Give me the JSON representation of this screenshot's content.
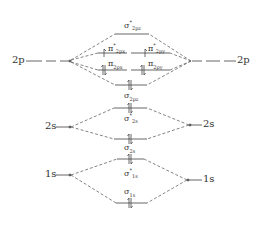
{
  "diagram": {
    "colors": {
      "line": "#555555",
      "text": "#333333",
      "background": "#ffffff"
    },
    "atomic_orbitals": {
      "left": [
        {
          "label": "2p",
          "y": 61
        },
        {
          "label": "2s",
          "y": 127
        },
        {
          "label": "1s",
          "y": 175
        }
      ],
      "right": [
        {
          "label": "2p",
          "y": 61
        },
        {
          "label": "2s",
          "y": 125
        },
        {
          "label": "1s",
          "y": 180
        }
      ]
    },
    "molecular_orbitals": [
      {
        "id": "sigma_star_2pz",
        "sym": "σ",
        "star": "*",
        "sub": "2p",
        "subsub": "z",
        "electrons": 0
      },
      {
        "id": "pi_star_2px",
        "sym": "π",
        "star": "*",
        "sub": "2p",
        "subsub": "x",
        "electrons": 1
      },
      {
        "id": "pi_star_2py",
        "sym": "π",
        "star": "*",
        "sub": "2p",
        "subsub": "y",
        "electrons": 1
      },
      {
        "id": "pi_2px",
        "sym": "π",
        "star": "",
        "sub": "2p",
        "subsub": "x",
        "electrons": 2
      },
      {
        "id": "pi_2py",
        "sym": "π",
        "star": "",
        "sub": "2p",
        "subsub": "y",
        "electrons": 2
      },
      {
        "id": "sigma_2pz",
        "sym": "σ",
        "star": "",
        "sub": "2p",
        "subsub": "z",
        "electrons": 2
      },
      {
        "id": "sigma_star_2s",
        "sym": "σ",
        "star": "*",
        "sub": "2s",
        "subsub": "",
        "electrons": 2
      },
      {
        "id": "sigma_2s",
        "sym": "σ",
        "star": "",
        "sub": "2s",
        "subsub": "",
        "electrons": 2
      },
      {
        "id": "sigma_star_1s",
        "sym": "σ",
        "star": "*",
        "sub": "1s",
        "subsub": "",
        "electrons": 2
      },
      {
        "id": "sigma_1s",
        "sym": "σ",
        "star": "",
        "sub": "1s",
        "subsub": "",
        "electrons": 2
      }
    ]
  }
}
